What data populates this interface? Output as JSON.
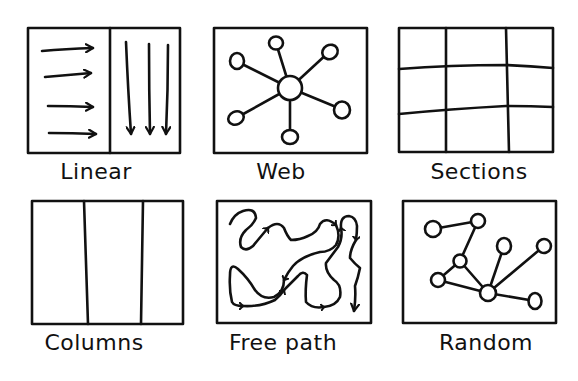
{
  "panels": [
    {
      "id": "linear",
      "label": "Linear"
    },
    {
      "id": "web",
      "label": "Web"
    },
    {
      "id": "sections",
      "label": "Sections"
    },
    {
      "id": "columns",
      "label": "Columns"
    },
    {
      "id": "free-path",
      "label": "Free path"
    },
    {
      "id": "random",
      "label": "Random"
    }
  ],
  "colors": {
    "ink": "#111111",
    "background": "#ffffff"
  }
}
